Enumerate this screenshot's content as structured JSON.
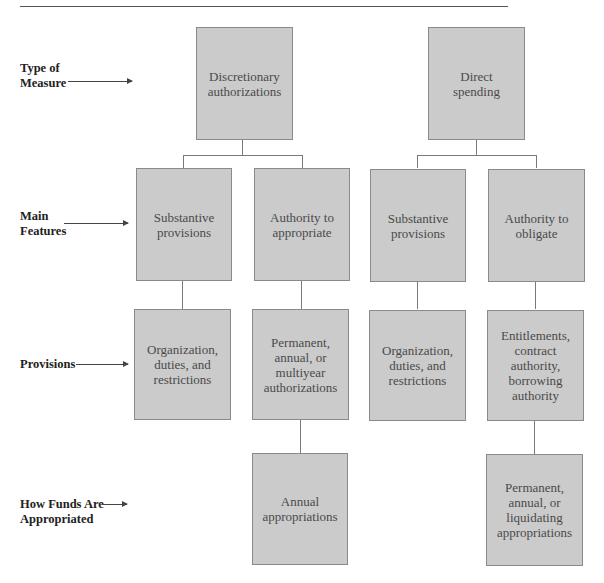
{
  "row_labels": [
    {
      "id": "type",
      "text": "Type of\nMeasure"
    },
    {
      "id": "features",
      "text": "Main\nFeatures"
    },
    {
      "id": "provisions",
      "text": "Provisions"
    },
    {
      "id": "funds",
      "text": "How Funds Are\nAppropriated"
    }
  ],
  "nodes": {
    "discretionary": "Discretionary\nauthorizations",
    "direct": "Direct\nspending",
    "subst_left": "Substantive\nprovisions",
    "auth_appropriate": "Authority to\nappropriate",
    "subst_right": "Substantive\nprovisions",
    "auth_obligate": "Authority to\nobligate",
    "org_left": "Organization,\nduties, and\nrestrictions",
    "perm_multi": "Permanent,\nannual, or\nmultiyear\nauthorizations",
    "org_right": "Organization,\nduties, and\nrestrictions",
    "entitlements": "Entitlements,\ncontract\nauthority,\nborrowing\nauthority",
    "annual_approp": "Annual\nappropriations",
    "perm_liquid": "Permanent,\nannual, or\nliquidating\nappropriations"
  },
  "colors": {
    "box_fill": "#cbcbcb",
    "box_border": "#8a8a8a",
    "connector": "#7a7a7a"
  }
}
